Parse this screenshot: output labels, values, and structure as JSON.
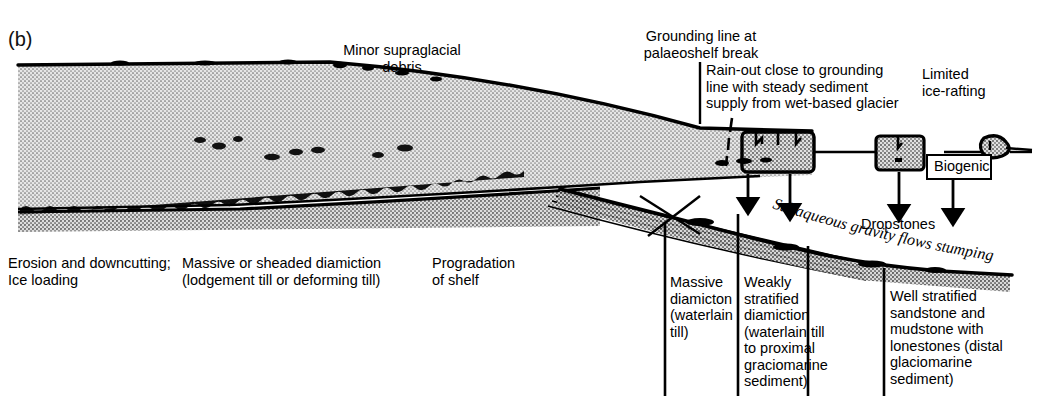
{
  "figure": {
    "panel_label": "(b)",
    "type": "glacial-depositional-system-cross-section"
  },
  "labels": {
    "supraglacial": "Minor supraglacial\ndebris",
    "grounding_line": "Grounding line at\npalaeoshelf break",
    "rainout": "Rain-out close to grounding\nline with steady sediment\nsupply from wet-based glacier",
    "limited_ice_rafting": "Limited\nice-rafting",
    "biogenic": "Biogenic",
    "dropstones": "Dropstones",
    "subaqueous": "Subaqueous gravity flows stumping",
    "erosion": "Erosion and downcutting;\nIce loading",
    "massive_sheaded": "Massive or sheaded diamiction\n(lodgement till or deforming till)",
    "progradation": "Progradation\nof shelf"
  },
  "facies_columns": [
    {
      "id": "massive-diamicton",
      "text": "Massive\ndiamicton\n(waterlain\ntill)"
    },
    {
      "id": "weakly-stratified-diamiction",
      "text": "Weakly\nstratified\ndiamiction\n(waterlain till\nto proximal\ngraciomarine\nsediment)"
    },
    {
      "id": "well-stratified-sandstone",
      "text": "Well stratified\nsandstone and\nmudstone with\nlonestones (distal\nglaciomarine\nsediment)"
    }
  ],
  "colors": {
    "ink": "#000000",
    "ice_fill": "#d9d9d9",
    "sediment_fill": "#b8b8b8",
    "background": "#ffffff"
  }
}
